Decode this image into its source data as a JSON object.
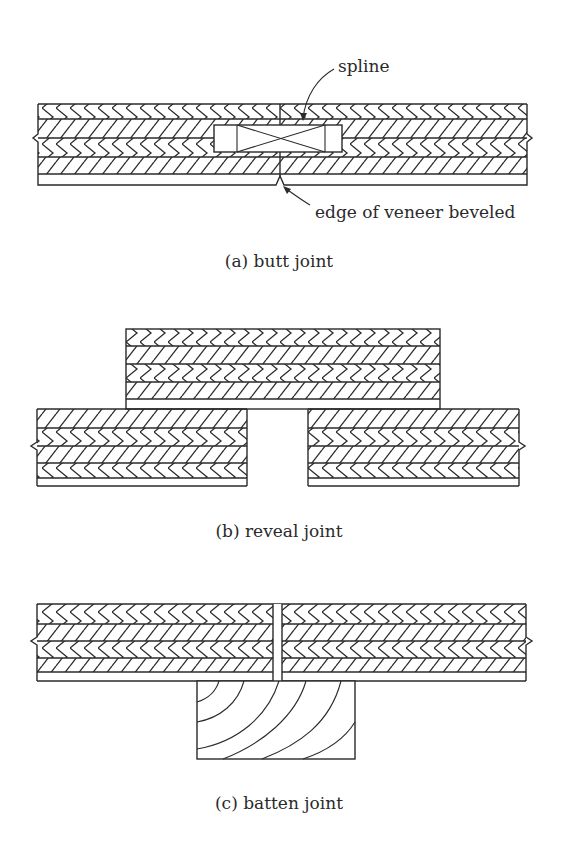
{
  "figure": {
    "panels": [
      {
        "id": "a",
        "caption": "(a) butt joint",
        "annotations": [
          {
            "label": "spline",
            "target": "spline"
          },
          {
            "label": "edge of veneer beveled",
            "target": "beveled-veneer-edge"
          }
        ],
        "components": [
          "plywood-panel-left",
          "plywood-panel-right",
          "spline",
          "face-veneer"
        ]
      },
      {
        "id": "b",
        "caption": "(b) reveal joint",
        "annotations": [],
        "components": [
          "overlay-panel",
          "plywood-panel-left",
          "plywood-panel-right",
          "reveal-gap"
        ]
      },
      {
        "id": "c",
        "caption": "(c) batten joint",
        "annotations": [],
        "components": [
          "plywood-panel-left",
          "plywood-panel-right",
          "joint-gap",
          "batten"
        ]
      }
    ],
    "colors": {
      "line": "#2a2a2a",
      "background": "#ffffff"
    }
  }
}
